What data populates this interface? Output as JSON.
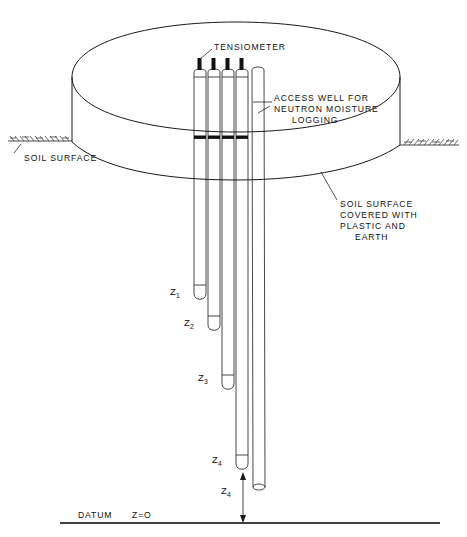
{
  "figure": {
    "labels": {
      "tensiometer": "TENSIOMETER",
      "access_well_line1": "ACCESS WELL FOR",
      "access_well_line2": "NEUTRON MOISTURE",
      "access_well_line3": "LOGGING",
      "soil_surface_left": "SOIL SURFACE",
      "covered_line1": "SOIL SURFACE",
      "covered_line2": "COVERED WITH",
      "covered_line3": "PLASTIC AND",
      "covered_line4": "EARTH",
      "datum": "DATUM",
      "datum_value": "Z=O"
    },
    "depths": [
      {
        "id": "z1",
        "text": "Z",
        "sub": "1"
      },
      {
        "id": "z2",
        "text": "Z",
        "sub": "2"
      },
      {
        "id": "z3",
        "text": "Z",
        "sub": "3"
      },
      {
        "id": "z4_tip",
        "text": "Z",
        "sub": "4"
      },
      {
        "id": "z4_dim",
        "text": "Z",
        "sub": "4"
      }
    ],
    "colors": {
      "ink": "#1a1a1a",
      "background": "#ffffff",
      "cap_fill": "#111111",
      "band_fill": "#111111"
    },
    "tubes": [
      {
        "name": "tensiometer-1",
        "kind": "tensiometer"
      },
      {
        "name": "tensiometer-2",
        "kind": "tensiometer"
      },
      {
        "name": "tensiometer-3",
        "kind": "tensiometer"
      },
      {
        "name": "tensiometer-4",
        "kind": "tensiometer"
      },
      {
        "name": "access-well",
        "kind": "access-well"
      }
    ]
  }
}
